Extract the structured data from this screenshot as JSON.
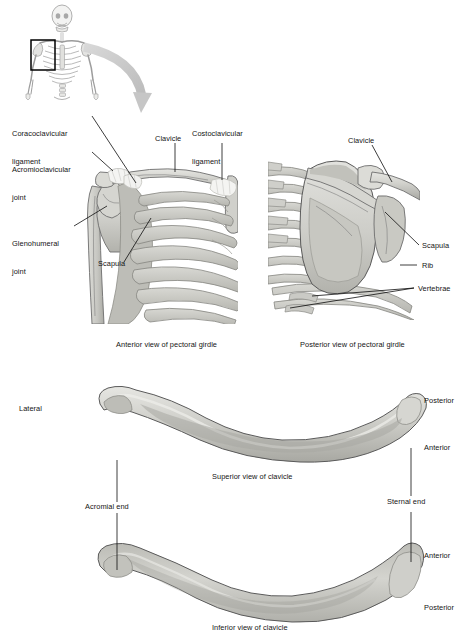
{
  "figure": {
    "background_color": "#ffffff",
    "text_color": "#141414",
    "bone_fill": "#c9c9c4",
    "bone_fill_light": "#dcdcd7",
    "bone_fill_dark": "#a9a9a3",
    "bone_stroke": "#6d6d6d",
    "arrow_color": "#c6c6c6",
    "skeleton_color": "#8d8d8d",
    "highlight_box_color": "#000000"
  },
  "orientation_thumbnail": {
    "name": "whole-body-skeleton",
    "highlight_box_label": ""
  },
  "panels": [
    {
      "id": "anterior-girdle",
      "caption": "Anterior view of pectoral girdle",
      "labels": [
        {
          "id": "coracoclavicular-ligament",
          "text": "Coracoclavicular\nligament",
          "line1": "Coracoclavicular",
          "line2": "ligament"
        },
        {
          "id": "acromioclavicular-joint",
          "text": "Acromioclavicular\njoint",
          "line1": "Acromioclavicular",
          "line2": "joint"
        },
        {
          "id": "glenohumeral-joint",
          "text": "Glenohumeral\njoint",
          "line1": "Glenohumeral",
          "line2": "joint"
        },
        {
          "id": "scapula",
          "text": "Scapula",
          "line1": "Scapula",
          "line2": ""
        },
        {
          "id": "clavicle",
          "text": "Clavicle",
          "line1": "Clavicle",
          "line2": ""
        },
        {
          "id": "costoclavicular-ligament",
          "text": "Costoclavicular\nligament",
          "line1": "Costoclavicular",
          "line2": "ligament"
        }
      ]
    },
    {
      "id": "posterior-girdle",
      "caption": "Posterior view of pectoral girdle",
      "labels": [
        {
          "id": "clavicle",
          "text": "Clavicle",
          "line1": "Clavicle",
          "line2": ""
        },
        {
          "id": "scapula",
          "text": "Scapula",
          "line1": "Scapula",
          "line2": ""
        },
        {
          "id": "rib",
          "text": "Rib",
          "line1": "Rib",
          "line2": ""
        },
        {
          "id": "vertebrae",
          "text": "Vertebrae",
          "line1": "Vertebrae",
          "line2": ""
        }
      ]
    },
    {
      "id": "superior-clavicle",
      "caption": "Superior view of clavicle",
      "labels": [
        {
          "id": "lateral",
          "text": "Lateral"
        },
        {
          "id": "posterior",
          "text": "Posterior"
        },
        {
          "id": "anterior",
          "text": "Anterior"
        },
        {
          "id": "acromial-end",
          "text": "Acromial end"
        },
        {
          "id": "sternal-end",
          "text": "Sternal end"
        }
      ]
    },
    {
      "id": "inferior-clavicle",
      "caption": "Inferior view of clavicle",
      "labels": [
        {
          "id": "anterior",
          "text": "Anterior"
        },
        {
          "id": "posterior",
          "text": "Posterior"
        }
      ]
    }
  ],
  "labels": {
    "coracoclavicular_l1": "Coracoclavicular",
    "coracoclavicular_l2": "ligament",
    "acromioclavicular_l1": "Acromioclavicular",
    "acromioclavicular_l2": "joint",
    "glenohumeral_l1": "Glenohumeral",
    "glenohumeral_l2": "joint",
    "scapula_anterior": "Scapula",
    "clavicle_anterior": "Clavicle",
    "costoclavicular_l1": "Costoclavicular",
    "costoclavicular_l2": "ligament",
    "clavicle_posterior": "Clavicle",
    "scapula_posterior": "Scapula",
    "rib": "Rib",
    "vertebrae": "Vertebrae",
    "lateral": "Lateral",
    "posterior_superior": "Posterior",
    "anterior_superior": "Anterior",
    "acromial_end": "Acromial end",
    "sternal_end": "Sternal end",
    "anterior_inferior": "Anterior",
    "posterior_inferior": "Posterior"
  },
  "captions": {
    "anterior_girdle": "Anterior view of pectoral girdle",
    "posterior_girdle": "Posterior view of pectoral girdle",
    "superior_clavicle": "Superior view of clavicle",
    "inferior_clavicle": "Inferior view of clavicle"
  }
}
